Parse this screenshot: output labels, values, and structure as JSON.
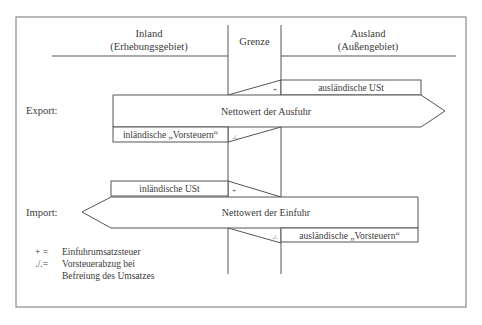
{
  "header": {
    "inland_title": "Inland",
    "inland_subtitle": "(Erhebungsgebiet)",
    "border_title": "Grenze",
    "abroad_title": "Ausland",
    "abroad_subtitle": "(Außengebiet)"
  },
  "export": {
    "label": "Export:",
    "arrow_text": "Nettowert der Ausfuhr",
    "top_box": "ausländische USt",
    "top_symbol": "+",
    "bottom_box": "inländische „Vorsteuern“",
    "bottom_symbol": "./."
  },
  "import": {
    "label": "Import:",
    "arrow_text": "Nettowert der Einfuhr",
    "top_box": "inländische USt",
    "top_symbol": "+",
    "bottom_box": "ausländische „Vorsteuern“",
    "bottom_symbol": "./."
  },
  "legend": [
    {
      "symbol": "+ =",
      "text": "Einfuhrumsatzsteuer"
    },
    {
      "symbol": "./.=",
      "text": "Vorsteuerabzug bei"
    },
    {
      "symbol": "",
      "text": "Befreiung des Umsatzes"
    }
  ]
}
